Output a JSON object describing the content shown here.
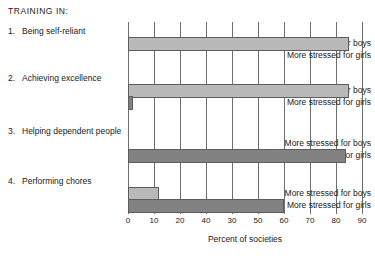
{
  "heading": "TRAINING  IN:",
  "chart_data": {
    "type": "bar",
    "orientation": "horizontal",
    "title": "TRAINING  IN:",
    "xlabel": "Percent of societies",
    "ylabel": "",
    "xlim": [
      0,
      90
    ],
    "grid": true,
    "legend": "none",
    "tick_values": [
      0,
      10,
      20,
      40,
      30,
      50,
      60,
      70,
      80,
      90
    ],
    "tick_positions": [
      0,
      10,
      20,
      30,
      40,
      50,
      60,
      70,
      80,
      90
    ],
    "tick_labels": [
      "0",
      "10",
      "20",
      "40",
      "30",
      "50",
      "60",
      "70",
      "80",
      "90"
    ],
    "categories": [
      "Being self-reliant",
      "Achieving excellence",
      "Helping dependent people",
      "Performing chores"
    ],
    "series": [
      {
        "name": "More stressed for boys",
        "color": "#b9b9b9",
        "values": [
          85,
          85,
          0,
          12
        ]
      },
      {
        "name": "More stressed for girls",
        "color": "#828282",
        "values": [
          0,
          2,
          84,
          60
        ]
      }
    ]
  },
  "groups": [
    {
      "number": "1.",
      "title": "Being self-reliant",
      "boys_label": "More stressed for boys",
      "girls_label": "More stressed for girls",
      "boys_value": 85,
      "girls_value": 0
    },
    {
      "number": "2.",
      "title": "Achieving excellence",
      "boys_label": "More stressed for boys",
      "girls_label": "More stressed for girls",
      "boys_value": 85,
      "girls_value": 2
    },
    {
      "number": "3.",
      "title": "Helping dependent people",
      "boys_label": "More stressed for boys",
      "girls_label": "More stressed for girls",
      "boys_value": 0,
      "girls_value": 84
    },
    {
      "number": "4.",
      "title": "Performing chores",
      "boys_label": "More stressed for boys",
      "girls_label": "More stressed for girls",
      "boys_value": 12,
      "girls_value": 60
    }
  ],
  "axis": {
    "title": "Percent of societies",
    "labels": [
      "0",
      "10",
      "20",
      "40",
      "30",
      "50",
      "60",
      "70",
      "80",
      "90"
    ]
  }
}
